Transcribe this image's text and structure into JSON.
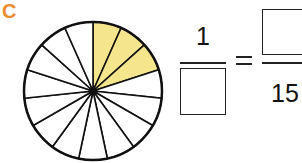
{
  "problem": {
    "label": "C",
    "label_color": "#ee8a2c"
  },
  "circle": {
    "total_sectors": 15,
    "shaded_sectors": 3,
    "shaded_color": "#f5e58c",
    "stroke_color": "#111111"
  },
  "equation": {
    "left": {
      "numerator": "1",
      "denominator": ""
    },
    "operator": "=",
    "right": {
      "numerator": "",
      "denominator": "15"
    }
  }
}
